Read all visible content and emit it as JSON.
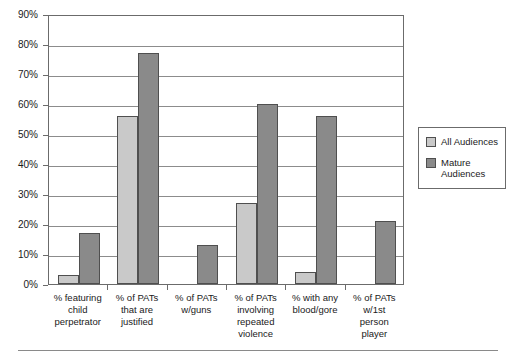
{
  "chart_data": {
    "type": "bar",
    "title": "",
    "subtitle": "",
    "xlabel": "",
    "ylabel": "",
    "ylim": [
      0,
      90
    ],
    "grid": true,
    "legend_position": "right",
    "y_ticks": [
      "0%",
      "10%",
      "20%",
      "30%",
      "40%",
      "50%",
      "60%",
      "70%",
      "80%",
      "90%"
    ],
    "y_tick_values": [
      0,
      10,
      20,
      30,
      40,
      50,
      60,
      70,
      80,
      90
    ],
    "categories": [
      "% featuring child perpetrator",
      "% of PATs that are justified",
      "% of PATs w/guns",
      "% of PATs involving repeated violence",
      "% with any blood/gore",
      "% of PATs w/1st person player"
    ],
    "category_lines": [
      [
        "% featuring",
        "child",
        "perpetrator"
      ],
      [
        "% of PATs",
        "that are",
        "justified"
      ],
      [
        "% of PATs",
        "w/guns"
      ],
      [
        "% of PATs",
        "involving",
        "repeated",
        "violence"
      ],
      [
        "% with any",
        "blood/gore"
      ],
      [
        "% of PATs",
        "w/1st",
        "person",
        "player"
      ]
    ],
    "series": [
      {
        "name": "All Audiences",
        "color": "#c9c9c9",
        "values": [
          3,
          56,
          0,
          27,
          4,
          0
        ]
      },
      {
        "name": "Mature Audiences",
        "color": "#8a8a8a",
        "values": [
          17,
          77,
          13,
          60,
          56,
          21
        ]
      }
    ]
  },
  "legend": {
    "entries": [
      {
        "label": "All Audiences"
      },
      {
        "label": "Mature Audiences"
      }
    ]
  }
}
